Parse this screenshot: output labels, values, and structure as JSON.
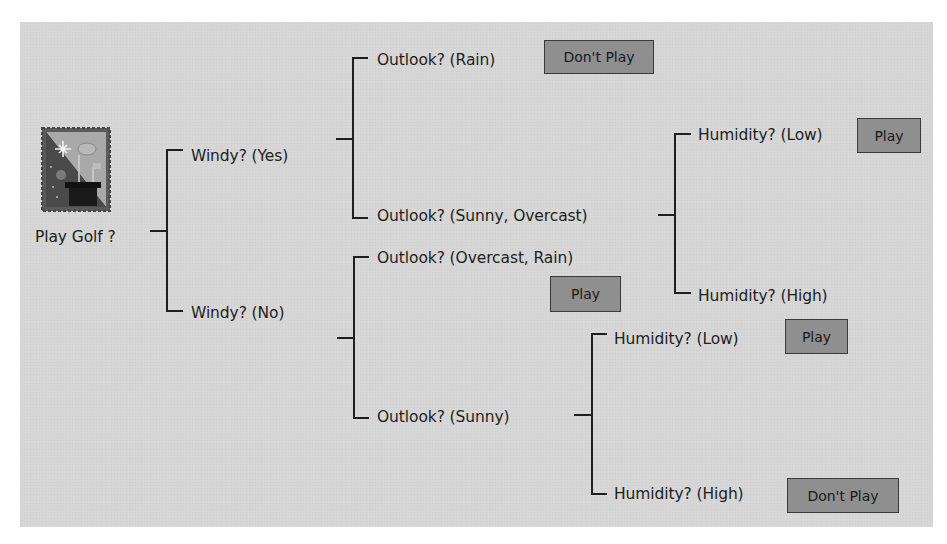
{
  "diagram": {
    "type": "decision-tree",
    "root": {
      "label": "Play Golf ?",
      "icon": "golf-bag-icon"
    },
    "nodes": {
      "windy_yes": "Windy? (Yes)",
      "windy_no": "Windy? (No)",
      "outlook_rain": "Outlook? (Rain)",
      "outlook_sunny_overcast": "Outlook? (Sunny, Overcast)",
      "outlook_overcast_rain": "Outlook? (Overcast, Rain)",
      "outlook_sunny": "Outlook? (Sunny)",
      "humidity_low_1": "Humidity? (Low)",
      "humidity_high_1": "Humidity? (High)",
      "humidity_low_2": "Humidity? (Low)",
      "humidity_high_2": "Humidity? (High)"
    },
    "outcomes": {
      "windy_yes_rain": "Don't Play",
      "windy_yes_sunny_overcast_low": "Play",
      "windy_no_overcast_rain": "Play",
      "windy_no_sunny_low": "Play",
      "windy_no_sunny_high": "Don't Play"
    },
    "colors": {
      "panel": "#d6d6d6",
      "outcome_fill": "#8f8f8f",
      "line": "#1e1e1e"
    }
  }
}
